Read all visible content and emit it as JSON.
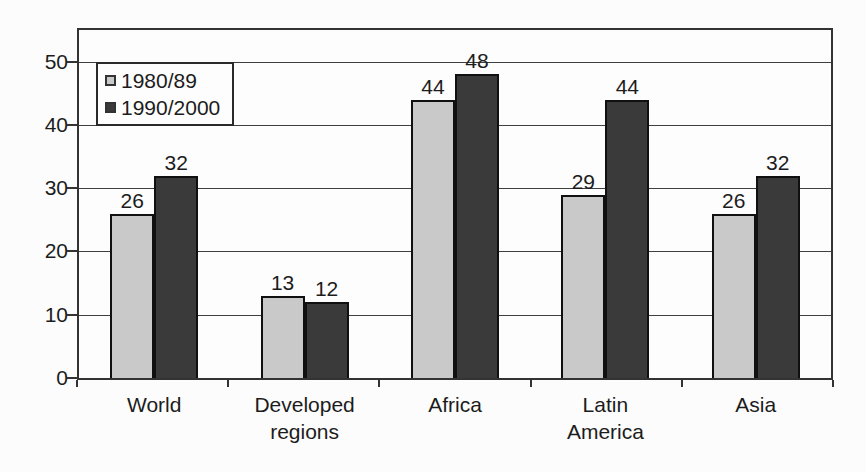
{
  "chart_data": {
    "type": "bar",
    "title": "",
    "xlabel": "",
    "ylabel": "",
    "categories": [
      "World",
      "Developed regions",
      "Africa",
      "Latin America",
      "Asia"
    ],
    "series": [
      {
        "name": "1980/89",
        "color": "#c9c9c9",
        "values": [
          26,
          13,
          44,
          29,
          26
        ]
      },
      {
        "name": "1990/2000",
        "color": "#3a3a3a",
        "values": [
          32,
          12,
          48,
          44,
          32
        ]
      }
    ],
    "ylim": [
      0,
      55
    ],
    "yticks": [
      0,
      10,
      20,
      30,
      40,
      50
    ],
    "grid": true,
    "legend_position": "top-left",
    "value_labels_shown": true
  },
  "style": {
    "axis_color": "#333333",
    "gridline_color": "#3f3f3f",
    "bar_border_color": "#101010",
    "background_color": "#fcfcfc",
    "legend_background": "#fdfdfd"
  }
}
